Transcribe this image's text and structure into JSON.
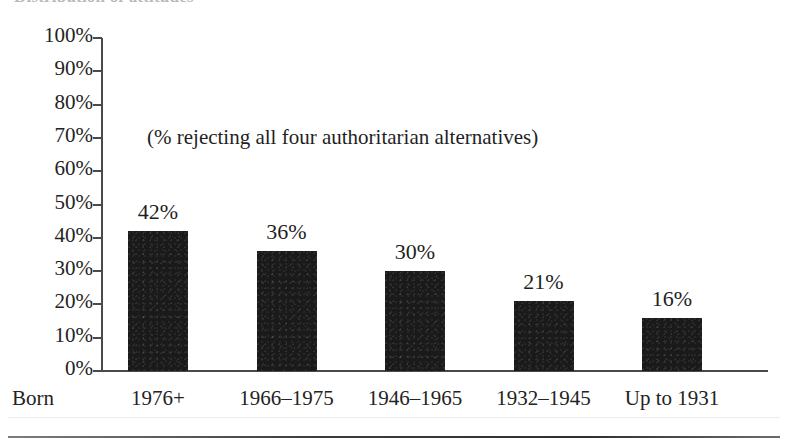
{
  "page": {
    "clipped_title": "Distribution of attitudes",
    "bottom_rule": "horizontal-rule"
  },
  "chart_data": {
    "type": "bar",
    "title": "",
    "annotation": "(% rejecting all four authoritarian alternatives)",
    "xlabel": "Born",
    "ylabel": "",
    "categories": [
      "1976+",
      "1966–1975",
      "1946–1965",
      "1932–1945",
      "Up to 1931"
    ],
    "values": [
      42,
      36,
      30,
      21,
      16
    ],
    "value_labels": [
      "42%",
      "36%",
      "30%",
      "21%",
      "16%"
    ],
    "ylim": [
      0,
      100
    ],
    "ytick_labels": [
      "100%",
      "90%",
      "80%",
      "70%",
      "60%",
      "50%",
      "40%",
      "30%",
      "20%",
      "10%",
      "0%"
    ],
    "ytick_values": [
      100,
      90,
      80,
      70,
      60,
      50,
      40,
      30,
      20,
      10,
      0
    ],
    "grid": false,
    "legend": "none",
    "bar_color": "#1a1a1a",
    "axis_color": "#4a4a4a",
    "background_color": "#ffffff"
  }
}
